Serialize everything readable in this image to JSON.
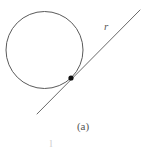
{
  "figure": {
    "caption": "(a)",
    "stray_text": "l",
    "background_color": "#ffffff",
    "stroke_color": "#5a5a5a",
    "point_color": "#111111",
    "width": 166,
    "height": 153
  },
  "labels": {
    "tangent_line": "r"
  },
  "geometry": {
    "circle": {
      "name": "circle",
      "center_x": 44.5,
      "center_y": 50,
      "radius": 38.5,
      "stroke_width": 1
    },
    "tangent_line": {
      "name": "tangent-line-r",
      "x1": 37,
      "y1": 114,
      "x2": 140,
      "y2": 10,
      "stroke_width": 1
    },
    "tangent_point": {
      "name": "tangent-point",
      "cx": 71,
      "cy": 78,
      "r": 2.6
    }
  }
}
